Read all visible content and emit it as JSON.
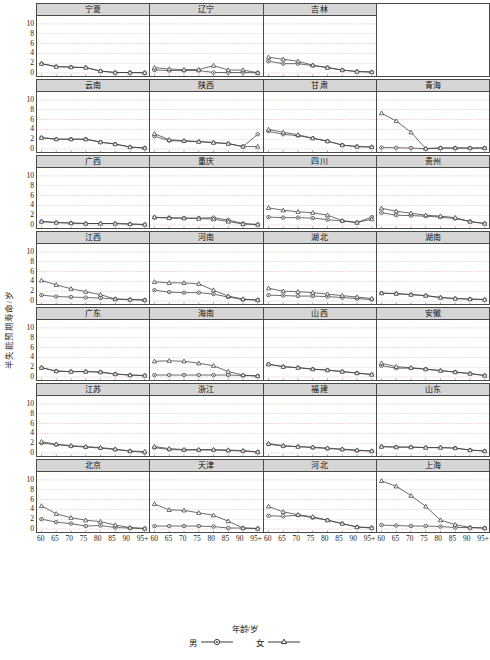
{
  "chart_data": {
    "type": "line",
    "title": "",
    "xlabel": "年龄/岁",
    "ylabel": "半失能预期寿命/岁",
    "ylim": [
      0,
      11
    ],
    "yticks": [
      0,
      2,
      4,
      6,
      8,
      10
    ],
    "x": [
      "60",
      "65",
      "70",
      "75",
      "80",
      "85",
      "90",
      "95+"
    ],
    "grid": true,
    "legend": [
      {
        "name": "男",
        "marker": "circle"
      },
      {
        "name": "女",
        "marker": "triangle"
      }
    ],
    "legend_position": "bottom-center",
    "panel_rows": [
      {
        "panels": [
          {
            "title": "宁夏",
            "series": [
              {
                "name": "男",
                "values": [
                  1.9,
                  1.3,
                  1.2,
                  1.1,
                  0.4,
                  0.1,
                  0.1,
                  0.05
                ]
              },
              {
                "name": "女",
                "values": [
                  1.9,
                  1.3,
                  1.2,
                  1.1,
                  0.4,
                  0.1,
                  0.1,
                  0.05
                ]
              }
            ]
          },
          {
            "title": "辽宁",
            "series": [
              {
                "name": "男",
                "values": [
                  0.6,
                  0.5,
                  0.5,
                  0.5,
                  0.1,
                  0.1,
                  0.1,
                  0.05
                ]
              },
              {
                "name": "女",
                "values": [
                  1.1,
                  0.8,
                  0.7,
                  0.7,
                  1.5,
                  0.6,
                  0.6,
                  0.05
                ]
              }
            ]
          },
          {
            "title": "吉林",
            "series": [
              {
                "name": "男",
                "values": [
                  2.4,
                  1.9,
                  1.9,
                  1.5,
                  1.1,
                  0.6,
                  0.3,
                  0.2
                ]
              },
              {
                "name": "女",
                "values": [
                  3.2,
                  2.8,
                  2.4,
                  1.6,
                  1.1,
                  0.6,
                  0.3,
                  0.2
                ]
              }
            ]
          },
          {
            "title": "",
            "blank": true,
            "series": []
          }
        ]
      },
      {
        "panels": [
          {
            "title": "云南",
            "series": [
              {
                "name": "男",
                "values": [
                  2.3,
                  2.0,
                  2.0,
                  2.0,
                  1.4,
                  1.0,
                  0.4,
                  0.2
                ]
              },
              {
                "name": "女",
                "values": [
                  2.3,
                  2.0,
                  2.0,
                  2.0,
                  1.4,
                  1.0,
                  0.4,
                  0.2
                ]
              }
            ]
          },
          {
            "title": "陕西",
            "series": [
              {
                "name": "男",
                "values": [
                  2.6,
                  1.7,
                  1.6,
                  1.5,
                  1.3,
                  1.1,
                  0.5,
                  3.0
                ]
              },
              {
                "name": "女",
                "values": [
                  3.1,
                  1.9,
                  1.7,
                  1.5,
                  1.3,
                  1.1,
                  0.5,
                  0.5
                ]
              }
            ]
          },
          {
            "title": "甘肃",
            "series": [
              {
                "name": "男",
                "values": [
                  3.6,
                  3.0,
                  2.7,
                  2.2,
                  1.6,
                  0.8,
                  0.5,
                  0.4
                ]
              },
              {
                "name": "女",
                "values": [
                  4.0,
                  3.4,
                  2.9,
                  2.2,
                  1.6,
                  0.8,
                  0.5,
                  0.4
                ]
              }
            ]
          },
          {
            "title": "青海",
            "series": [
              {
                "name": "男",
                "values": [
                  0.3,
                  0.25,
                  0.2,
                  0.05,
                  0.2,
                  0.2,
                  0.2,
                  0.2
                ]
              },
              {
                "name": "女",
                "values": [
                  7.3,
                  5.7,
                  3.4,
                  0.1,
                  0.2,
                  0.2,
                  0.2,
                  0.2
                ]
              }
            ]
          }
        ]
      },
      {
        "panels": [
          {
            "title": "广西",
            "series": [
              {
                "name": "男",
                "values": [
                  0.7,
                  0.5,
                  0.4,
                  0.3,
                  0.3,
                  0.3,
                  0.2,
                  0.1
                ]
              },
              {
                "name": "女",
                "values": [
                  0.7,
                  0.5,
                  0.4,
                  0.3,
                  0.3,
                  0.3,
                  0.2,
                  0.1
                ]
              }
            ]
          },
          {
            "title": "重庆",
            "series": [
              {
                "name": "男",
                "values": [
                  1.5,
                  1.5,
                  1.4,
                  1.4,
                  1.5,
                  1.0,
                  0.3,
                  0.1
                ]
              },
              {
                "name": "女",
                "values": [
                  1.6,
                  1.4,
                  1.4,
                  1.3,
                  1.2,
                  0.7,
                  0.2,
                  0.1
                ]
              }
            ]
          },
          {
            "title": "四川",
            "series": [
              {
                "name": "男",
                "values": [
                  1.6,
                  1.5,
                  1.5,
                  1.4,
                  1.1,
                  0.8,
                  0.5,
                  1.6
                ]
              },
              {
                "name": "女",
                "values": [
                  3.5,
                  3.0,
                  2.7,
                  2.5,
                  2.0,
                  0.9,
                  0.5,
                  1.2
                ]
              }
            ]
          },
          {
            "title": "贵州",
            "series": [
              {
                "name": "男",
                "values": [
                  2.5,
                  2.0,
                  1.9,
                  1.8,
                  1.6,
                  1.3,
                  0.7,
                  0.3
                ]
              },
              {
                "name": "女",
                "values": [
                  3.4,
                  2.8,
                  2.4,
                  2.0,
                  1.8,
                  1.5,
                  0.7,
                  0.3
                ]
              }
            ]
          }
        ]
      },
      {
        "panels": [
          {
            "title": "江西",
            "series": [
              {
                "name": "男",
                "values": [
                  1.2,
                  0.9,
                  0.8,
                  0.7,
                  0.6,
                  0.4,
                  0.3,
                  0.2
                ]
              },
              {
                "name": "女",
                "values": [
                  4.2,
                  3.3,
                  2.5,
                  1.9,
                  1.3,
                  0.4,
                  0.3,
                  0.2
                ]
              }
            ]
          },
          {
            "title": "河南",
            "series": [
              {
                "name": "男",
                "values": [
                  2.2,
                  1.8,
                  1.7,
                  1.7,
                  1.4,
                  0.8,
                  0.3,
                  0.2
                ]
              },
              {
                "name": "女",
                "values": [
                  3.9,
                  3.7,
                  3.7,
                  3.5,
                  2.2,
                  1.0,
                  0.4,
                  0.2
                ]
              }
            ]
          },
          {
            "title": "湖北",
            "series": [
              {
                "name": "男",
                "values": [
                  1.2,
                  1.1,
                  1.0,
                  1.0,
                  0.9,
                  0.7,
                  0.5,
                  0.3
                ]
              },
              {
                "name": "女",
                "values": [
                  2.6,
                  2.0,
                  1.9,
                  1.7,
                  1.4,
                  1.1,
                  0.8,
                  0.5
                ]
              }
            ]
          },
          {
            "title": "湖南",
            "series": [
              {
                "name": "男",
                "values": [
                  1.6,
                  1.5,
                  1.3,
                  1.1,
                  0.7,
                  0.5,
                  0.4,
                  0.3
                ]
              },
              {
                "name": "女",
                "values": [
                  1.6,
                  1.5,
                  1.3,
                  1.1,
                  0.7,
                  0.5,
                  0.4,
                  0.3
                ]
              }
            ]
          }
        ]
      },
      {
        "panels": [
          {
            "title": "广东",
            "series": [
              {
                "name": "男",
                "values": [
                  1.9,
                  1.2,
                  1.1,
                  1.1,
                  1.0,
                  0.6,
                  0.4,
                  0.3
                ]
              },
              {
                "name": "女",
                "values": [
                  1.9,
                  1.2,
                  1.1,
                  1.1,
                  1.0,
                  0.6,
                  0.4,
                  0.3
                ]
              }
            ]
          },
          {
            "title": "海南",
            "series": [
              {
                "name": "男",
                "values": [
                  0.4,
                  0.4,
                  0.4,
                  0.4,
                  0.4,
                  0.4,
                  0.3,
                  0.2
                ]
              },
              {
                "name": "女",
                "values": [
                  3.2,
                  3.3,
                  3.2,
                  2.8,
                  2.3,
                  1.1,
                  0.4,
                  0.2
                ]
              }
            ]
          },
          {
            "title": "山西",
            "series": [
              {
                "name": "男",
                "values": [
                  2.6,
                  2.1,
                  1.9,
                  1.6,
                  1.4,
                  1.1,
                  0.8,
                  0.5
                ]
              },
              {
                "name": "女",
                "values": [
                  2.6,
                  2.1,
                  1.9,
                  1.6,
                  1.4,
                  1.1,
                  0.8,
                  0.5
                ]
              }
            ]
          },
          {
            "title": "安徽",
            "series": [
              {
                "name": "男",
                "values": [
                  2.3,
                  1.8,
                  1.8,
                  1.6,
                  1.3,
                  1.0,
                  0.7,
                  0.3
                ]
              },
              {
                "name": "女",
                "values": [
                  2.8,
                  2.1,
                  1.9,
                  1.6,
                  1.3,
                  1.0,
                  0.7,
                  0.3
                ]
              }
            ]
          }
        ]
      },
      {
        "panels": [
          {
            "title": "江苏",
            "series": [
              {
                "name": "男",
                "values": [
                  2.0,
                  1.7,
                  1.4,
                  1.2,
                  1.0,
                  0.7,
                  0.4,
                  0.1
                ]
              },
              {
                "name": "女",
                "values": [
                  2.3,
                  1.8,
                  1.5,
                  1.3,
                  1.1,
                  0.8,
                  0.4,
                  0.3
                ]
              }
            ]
          },
          {
            "title": "浙江",
            "series": [
              {
                "name": "男",
                "values": [
                  1.1,
                  0.7,
                  0.6,
                  0.6,
                  0.6,
                  0.5,
                  0.4,
                  0.2
                ]
              },
              {
                "name": "女",
                "values": [
                  1.3,
                  0.9,
                  0.7,
                  0.7,
                  0.7,
                  0.6,
                  0.5,
                  0.2
                ]
              }
            ]
          },
          {
            "title": "福建",
            "series": [
              {
                "name": "男",
                "values": [
                  1.8,
                  1.4,
                  1.3,
                  1.1,
                  0.9,
                  0.7,
                  0.5,
                  0.4
                ]
              },
              {
                "name": "女",
                "values": [
                  1.9,
                  1.5,
                  1.3,
                  1.2,
                  1.0,
                  0.8,
                  0.6,
                  0.4
                ]
              }
            ]
          },
          {
            "title": "山东",
            "series": [
              {
                "name": "男",
                "values": [
                  1.3,
                  1.2,
                  1.2,
                  1.1,
                  1.1,
                  1.0,
                  0.6,
                  0.4
                ]
              },
              {
                "name": "女",
                "values": [
                  1.3,
                  1.2,
                  1.2,
                  1.1,
                  1.1,
                  1.0,
                  0.6,
                  0.4
                ]
              }
            ]
          }
        ]
      },
      {
        "panels": [
          {
            "title": "北京",
            "series": [
              {
                "name": "男",
                "values": [
                  2.0,
                  1.4,
                  1.1,
                  0.6,
                  0.7,
                  0.3,
                  0.2,
                  0.1
                ]
              },
              {
                "name": "女",
                "values": [
                  4.7,
                  3.1,
                  2.3,
                  1.8,
                  1.5,
                  0.8,
                  0.3,
                  0.1
                ]
              }
            ]
          },
          {
            "title": "天津",
            "series": [
              {
                "name": "男",
                "values": [
                  0.6,
                  0.6,
                  0.6,
                  0.6,
                  0.5,
                  0.2,
                  0.2,
                  0.1
                ]
              },
              {
                "name": "女",
                "values": [
                  5.1,
                  3.9,
                  3.8,
                  3.3,
                  2.8,
                  1.6,
                  0.2,
                  0.1
                ]
              }
            ]
          },
          {
            "title": "河北",
            "series": [
              {
                "name": "男",
                "values": [
                  2.7,
                  2.6,
                  2.8,
                  2.3,
                  1.8,
                  1.1,
                  0.4,
                  0.3
                ]
              },
              {
                "name": "女",
                "values": [
                  4.6,
                  3.5,
                  2.9,
                  2.5,
                  1.8,
                  1.1,
                  0.4,
                  0.2
                ]
              }
            ]
          },
          {
            "title": "上海",
            "series": [
              {
                "name": "男",
                "values": [
                  0.8,
                  0.7,
                  0.6,
                  0.6,
                  0.5,
                  0.3,
                  0.3,
                  0.2
                ]
              },
              {
                "name": "女",
                "values": [
                  9.8,
                  8.7,
                  6.8,
                  4.6,
                  1.8,
                  0.9,
                  0.3,
                  0.2
                ]
              }
            ]
          }
        ]
      }
    ]
  },
  "style": {
    "line_color": "#3a3a3a",
    "grid_color": "#d25a5a",
    "panel_border": "#4a4a4a",
    "title_bg": "#d6d6d6",
    "axis_color": "#333333"
  }
}
